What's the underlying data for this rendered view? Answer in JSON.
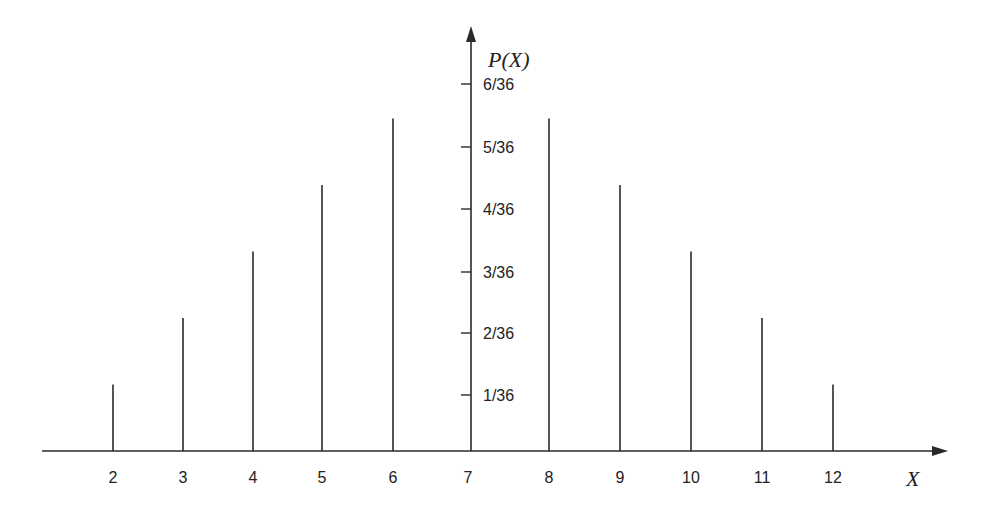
{
  "chart_data": {
    "type": "bar",
    "subtype": "stem",
    "title": "",
    "xlabel": "X",
    "ylabel": "P(X)",
    "categories": [
      "2",
      "3",
      "4",
      "5",
      "6",
      "7",
      "8",
      "9",
      "10",
      "11",
      "12"
    ],
    "values": [
      0.02778,
      0.05556,
      0.08333,
      0.11111,
      0.13889,
      0.16667,
      0.13889,
      0.11111,
      0.08333,
      0.05556,
      0.02778
    ],
    "values_fraction": [
      "1/36",
      "2/36",
      "3/36",
      "4/36",
      "5/36",
      "6/36",
      "5/36",
      "4/36",
      "3/36",
      "2/36",
      "1/36"
    ],
    "y_tick_labels": [
      "1/36",
      "2/36",
      "3/36",
      "4/36",
      "5/36",
      "6/36"
    ],
    "x_tick_labels": [
      "2",
      "3",
      "4",
      "5",
      "6",
      "7",
      "8",
      "9",
      "10",
      "11",
      "12"
    ],
    "ylim": [
      0,
      0.1667
    ],
    "grid": false,
    "legend": null
  },
  "colors": {
    "stroke": "#2a2a2a",
    "background": "#ffffff"
  }
}
